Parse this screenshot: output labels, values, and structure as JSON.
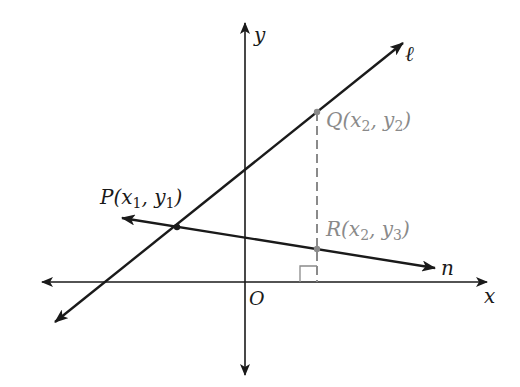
{
  "diagram": {
    "type": "coordinate-geometry",
    "axes": {
      "x_label": "x",
      "y_label": "y",
      "origin_label": "O"
    },
    "lines": [
      {
        "name": "ℓ",
        "label": "ℓ",
        "passes_through": [
          "P",
          "Q"
        ]
      },
      {
        "name": "n",
        "label": "n",
        "passes_through": [
          "P",
          "R"
        ]
      }
    ],
    "points": {
      "P": {
        "label": "P(x",
        "sub1": "1",
        "mid": ", y",
        "sub2": "1",
        "end": ")"
      },
      "Q": {
        "label": "Q(x",
        "sub1": "2",
        "mid": ", y",
        "sub2": "2",
        "end": ")"
      },
      "R": {
        "label": "R(x",
        "sub1": "2",
        "mid": ", y",
        "sub2": "3",
        "end": ")"
      }
    },
    "annotations": {
      "dashed_segment": "QR vertical at x = x2",
      "right_angle": "at foot of QR on x-axis"
    },
    "colors": {
      "lines": "#1a1a1a",
      "highlight": "#8a8a8a"
    }
  }
}
